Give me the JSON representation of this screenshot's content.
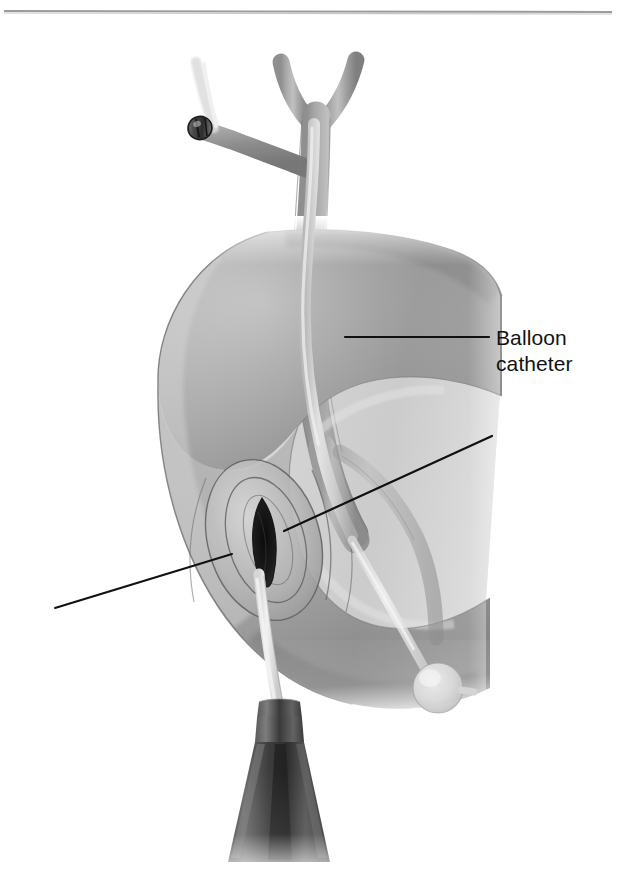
{
  "figure": {
    "domain": "medical-illustration",
    "title_visible": false,
    "background_color": "#ffffff",
    "width": 619,
    "height": 886,
    "top_rule": {
      "visible": true,
      "color": "#9a9a9a",
      "y": 11,
      "x_start": 4,
      "x_end": 612,
      "thickness": 2
    }
  },
  "labels": [
    {
      "id": "balloon-catheter",
      "text": "Balloon\ncatheter",
      "line1": "Balloon",
      "line2": "catheter",
      "x": 496,
      "y": 325,
      "font_size_px": 21,
      "color": "#121212"
    }
  ],
  "leader_lines": [
    {
      "id": "leader-balloon-catheter",
      "label": "balloon-catheter",
      "x1": 345,
      "y1": 337,
      "x2": 489,
      "y2": 337,
      "color": "#101010",
      "width": 2.2,
      "has_label": true
    },
    {
      "id": "leader-papilla",
      "label": "",
      "x1": 284,
      "y1": 531,
      "x2": 492,
      "y2": 436,
      "color": "#101010",
      "width": 2.2,
      "has_label": false
    },
    {
      "id": "leader-duodenotomy",
      "label": "",
      "x1": 232,
      "y1": 554,
      "x2": 55,
      "y2": 608,
      "color": "#101010",
      "width": 2.0,
      "has_label": false
    }
  ],
  "anatomy": {
    "duodenum": {
      "name": "duodenum",
      "description": "C-shaped duodenal loop shown in cutaway",
      "fill_light": "#d2d2d2",
      "fill_mid": "#8d8d8d",
      "fill_dark": "#6f6f6f",
      "outline": "#6a6a6a"
    },
    "common_bile_duct": {
      "name": "common-bile-duct",
      "fill_light": "#b8b8b8",
      "fill_mid": "#8f8f8f",
      "outline": "#777777"
    },
    "hepatic_duct_bifurcation": {
      "name": "hepatic-duct-bifurcation",
      "description": "Y-shaped right and left hepatic duct confluence at top"
    },
    "cystic_duct_stump": {
      "name": "cystic-duct-stump",
      "description": "Short duct branching to upper left, closed with surgical clip"
    },
    "surgical_clip": {
      "name": "surgical-clip",
      "x": 200,
      "y": 128,
      "fill": "#555555",
      "outline": "#1e1e1e"
    },
    "duodenotomy": {
      "name": "duodenotomy-incision",
      "description": "Longitudinal incision in anterior duodenal wall exposing dark lumen",
      "center_x": 264,
      "center_y": 540,
      "lumen_color": "#1b1b1b"
    },
    "papilla": {
      "name": "papilla-of-vater",
      "description": "Ampullary papilla at the distal bile duct entering the duodenum"
    }
  },
  "instrument": {
    "name": "balloon-catheter",
    "shaft": {
      "color_light": "#cfcfcf",
      "color_mid": "#9a9a9a",
      "description": "Flexible catheter shaft running down the common bile duct, through the papilla and out of the duodenotomy"
    },
    "balloon": {
      "name": "inflated-balloon",
      "cx": 438,
      "cy": 688,
      "r": 25,
      "fill": "#e6e6e6",
      "description": "Inflated retrieval balloon within the duodenal lumen"
    },
    "hub": {
      "name": "catheter-hub",
      "x": 277,
      "y": 700,
      "color_light": "#6e6e6e",
      "color_dark": "#2a2a2a",
      "description": "Tapered dark catheter hub / handle exiting at the bottom of the frame"
    }
  }
}
